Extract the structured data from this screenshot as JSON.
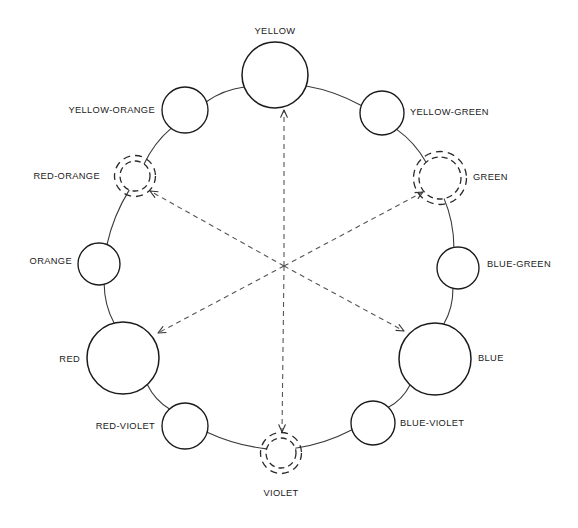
{
  "diagram": {
    "type": "color-wheel",
    "background_color": "#ffffff",
    "stroke_color": "#1a1a1a",
    "center": {
      "x": 284,
      "y": 266
    },
    "nodes": [
      {
        "id": "yellow",
        "label": "YELLOW",
        "cx": 275,
        "cy": 75,
        "r": 33,
        "style": "solid",
        "size": "large",
        "label_x": 275,
        "label_y": 32,
        "label_anchor": "middle"
      },
      {
        "id": "yellow-green",
        "label": "YELLOW-GREEN",
        "cx": 382,
        "cy": 113,
        "r": 22,
        "style": "solid",
        "size": "medium",
        "label_x": 410,
        "label_y": 113,
        "label_anchor": "start"
      },
      {
        "id": "green",
        "label": "GREEN",
        "cx": 440,
        "cy": 178,
        "r": 21,
        "style": "double-dashed",
        "size": "medium",
        "label_x": 473,
        "label_y": 178,
        "label_anchor": "start"
      },
      {
        "id": "blue-green",
        "label": "BLUE-GREEN",
        "cx": 458,
        "cy": 268,
        "r": 21,
        "style": "solid",
        "size": "medium",
        "label_x": 487,
        "label_y": 265,
        "label_anchor": "start"
      },
      {
        "id": "blue",
        "label": "BLUE",
        "cx": 435,
        "cy": 359,
        "r": 36,
        "style": "solid",
        "size": "large",
        "label_x": 478,
        "label_y": 359,
        "label_anchor": "start"
      },
      {
        "id": "blue-violet",
        "label": "BLUE-VIOLET",
        "cx": 373,
        "cy": 423,
        "r": 22,
        "style": "solid",
        "size": "medium",
        "label_x": 400,
        "label_y": 424,
        "label_anchor": "start"
      },
      {
        "id": "violet",
        "label": "VIOLET",
        "cx": 281,
        "cy": 453,
        "r": 15,
        "style": "double-dashed",
        "size": "small",
        "label_x": 281,
        "label_y": 494,
        "label_anchor": "middle"
      },
      {
        "id": "red-violet",
        "label": "RED-VIOLET",
        "cx": 185,
        "cy": 426,
        "r": 23,
        "style": "solid",
        "size": "medium",
        "label_x": 155,
        "label_y": 427,
        "label_anchor": "end"
      },
      {
        "id": "red",
        "label": "RED",
        "cx": 123,
        "cy": 358,
        "r": 36,
        "style": "solid",
        "size": "large",
        "label_x": 80,
        "label_y": 360,
        "label_anchor": "end"
      },
      {
        "id": "orange",
        "label": "ORANGE",
        "cx": 99,
        "cy": 264,
        "r": 21,
        "style": "solid",
        "size": "medium",
        "label_x": 72,
        "label_y": 262,
        "label_anchor": "end"
      },
      {
        "id": "red-orange",
        "label": "RED-ORANGE",
        "cx": 135,
        "cy": 176,
        "r": 15,
        "style": "double-dashed",
        "size": "small",
        "label_x": 100,
        "label_y": 177,
        "label_anchor": "end"
      },
      {
        "id": "yellow-orange",
        "label": "YELLOW-ORANGE",
        "cx": 185,
        "cy": 110,
        "r": 23,
        "style": "solid",
        "size": "medium",
        "label_x": 155,
        "label_y": 111,
        "label_anchor": "end"
      }
    ],
    "spokes": [
      {
        "from": "yellow",
        "to": "yellow-green"
      },
      {
        "from": "yellow-green",
        "to": "green"
      },
      {
        "from": "green",
        "to": "blue-green"
      },
      {
        "from": "blue-green",
        "to": "blue"
      },
      {
        "from": "blue",
        "to": "blue-violet"
      },
      {
        "from": "blue-violet",
        "to": "violet"
      },
      {
        "from": "violet",
        "to": "red-violet"
      },
      {
        "from": "red-violet",
        "to": "red"
      },
      {
        "from": "red",
        "to": "orange"
      },
      {
        "from": "orange",
        "to": "red-orange"
      },
      {
        "from": "red-orange",
        "to": "yellow-orange"
      },
      {
        "from": "yellow-orange",
        "to": "yellow"
      }
    ],
    "arrows": [
      {
        "id": "arrow-to-yellow",
        "target": "yellow",
        "end_x": 284,
        "end_y": 110
      },
      {
        "id": "arrow-to-green",
        "target": "green",
        "end_x": 423,
        "end_y": 192
      },
      {
        "id": "arrow-to-blue",
        "target": "blue",
        "end_x": 404,
        "end_y": 331
      },
      {
        "id": "arrow-to-violet",
        "target": "violet",
        "end_x": 282,
        "end_y": 432
      },
      {
        "id": "arrow-to-red",
        "target": "red",
        "end_x": 158,
        "end_y": 333
      },
      {
        "id": "arrow-to-red-orange",
        "target": "red-orange",
        "end_x": 150,
        "end_y": 191
      }
    ]
  }
}
